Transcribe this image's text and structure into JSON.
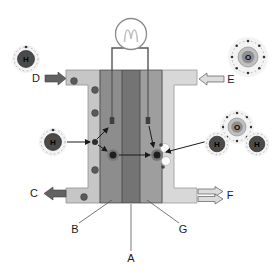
{
  "diagram": {
    "type": "hydrogen-fuel-cell-diagram",
    "labels": {
      "a": "A",
      "b": "B",
      "c": "C",
      "d": "D",
      "e": "E",
      "f": "F",
      "g": "G"
    },
    "atoms": {
      "hydrogen": "H",
      "oxygen": "O"
    },
    "colors": {
      "left_channel": "#c6c6c6",
      "right_channel": "#d8d8d8",
      "anode": "#8d8d8d",
      "membrane": "#747474",
      "cathode": "#9e9e9e",
      "dark_arrow": "#626262",
      "light_arrow": "#dcdcdc",
      "wire": "#555555",
      "particle": "#5a5a5a"
    }
  }
}
